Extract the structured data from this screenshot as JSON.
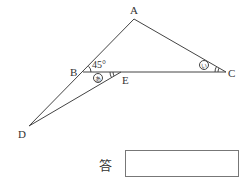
{
  "diagram": {
    "points": {
      "A": {
        "label": "A",
        "x": 134,
        "y": 19
      },
      "B": {
        "label": "B",
        "x": 83,
        "y": 72
      },
      "C": {
        "label": "C",
        "x": 226,
        "y": 72
      },
      "D": {
        "label": "D",
        "x": 29,
        "y": 126
      },
      "E": {
        "label": "E",
        "x": 121,
        "y": 72
      }
    },
    "segments": [
      "A-D",
      "A-C",
      "B-C",
      "D-E"
    ],
    "angles": {
      "ABC": "45°",
      "BED": "あ",
      "ACB": "い"
    }
  },
  "answer": {
    "label": "答",
    "value": ""
  }
}
